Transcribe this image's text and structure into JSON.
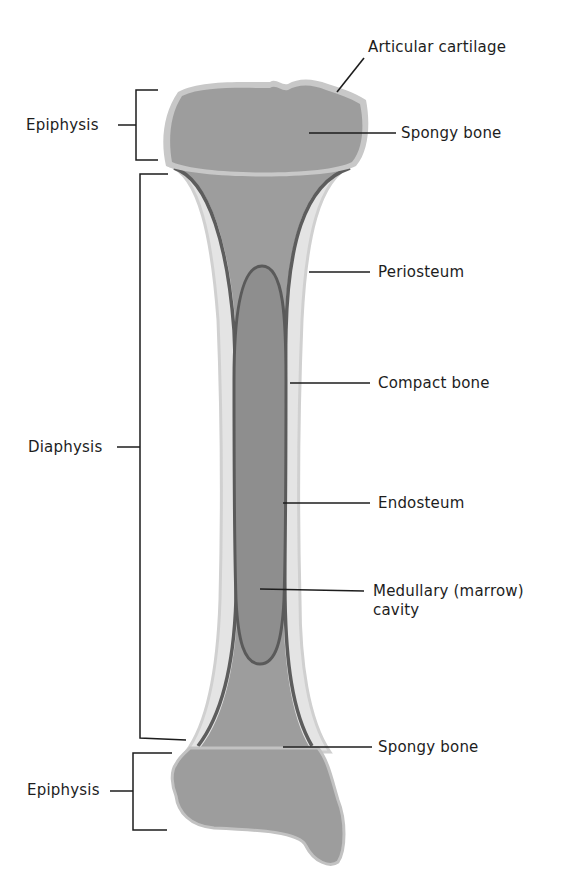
{
  "diagram": {
    "colors": {
      "background": "#ffffff",
      "spongy_bone": "#9c9c9c",
      "articular_cartilage": "#c9c9c9",
      "compact_bone": "#e6e6e6",
      "periosteum_edge": "#cfcfcf",
      "endosteum_line": "#5c5c5c",
      "marrow_cavity": "#8c8c8c",
      "leader_line": "#1d1d1d",
      "text": "#1d1d1d"
    },
    "left_labels": [
      {
        "id": "epiphysis-top",
        "text": "Epiphysis"
      },
      {
        "id": "diaphysis",
        "text": "Diaphysis"
      },
      {
        "id": "epiphysis-bottom",
        "text": "Epiphysis"
      }
    ],
    "right_labels": [
      {
        "id": "articular-cartilage",
        "text": "Articular cartilage"
      },
      {
        "id": "spongy-bone-top",
        "text": "Spongy bone"
      },
      {
        "id": "periosteum",
        "text": "Periosteum"
      },
      {
        "id": "compact-bone",
        "text": "Compact bone"
      },
      {
        "id": "endosteum",
        "text": "Endosteum"
      },
      {
        "id": "medullary-cavity",
        "text": "Medullary (marrow)",
        "text_line2": "cavity"
      },
      {
        "id": "spongy-bone-bottom",
        "text": "Spongy bone"
      }
    ]
  }
}
